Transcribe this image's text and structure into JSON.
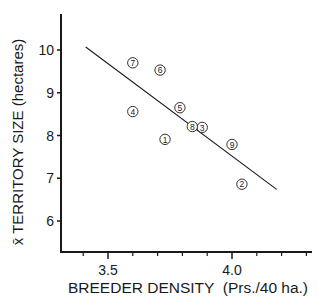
{
  "chart_data": {
    "type": "scatter",
    "title": "",
    "xlabel": "BREEDER DENSITY  (Prs./40 ha.)",
    "ylabel": "x̄ TERRITORY SIZE (hectares)",
    "xlim": [
      3.25,
      4.35
    ],
    "ylim": [
      5.3,
      11.0
    ],
    "x_ticks": [
      {
        "value": 3.5,
        "label": "3.5"
      },
      {
        "value": 4.0,
        "label": "4.0"
      }
    ],
    "x_minor_ticks": [
      3.4,
      3.6,
      3.7,
      3.8,
      3.9,
      4.1,
      4.2,
      4.3
    ],
    "y_ticks": [
      {
        "value": 10,
        "label": "10"
      },
      {
        "value": 9,
        "label": "9"
      },
      {
        "value": 8,
        "label": "8"
      },
      {
        "value": 7,
        "label": "7"
      },
      {
        "value": 6,
        "label": "6"
      }
    ],
    "grid": false,
    "points": [
      {
        "label": "1",
        "x": 3.73,
        "y": 7.91
      },
      {
        "label": "2",
        "x": 4.04,
        "y": 6.86
      },
      {
        "label": "3",
        "x": 3.88,
        "y": 8.19
      },
      {
        "label": "4",
        "x": 3.6,
        "y": 8.56
      },
      {
        "label": "5",
        "x": 3.79,
        "y": 8.65
      },
      {
        "label": "6",
        "x": 3.71,
        "y": 9.53
      },
      {
        "label": "7",
        "x": 3.6,
        "y": 9.7
      },
      {
        "label": "8",
        "x": 3.84,
        "y": 8.21
      },
      {
        "label": "9",
        "x": 4.0,
        "y": 7.79
      }
    ],
    "regression_line": {
      "x": [
        3.41,
        4.18
      ],
      "y": [
        10.07,
        6.74
      ]
    }
  }
}
